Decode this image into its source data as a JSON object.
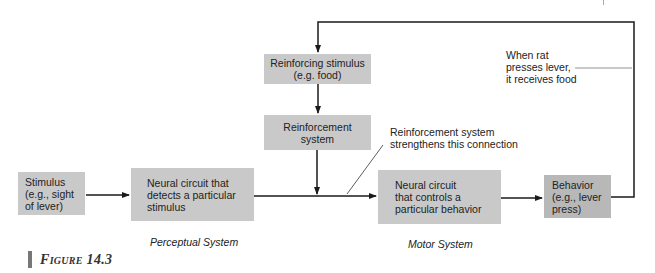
{
  "diagram": {
    "nodes": {
      "reinforcing_stimulus": {
        "lines": [
          "Reinforcing stimulus",
          "(e.g. food)"
        ]
      },
      "reinforcement_system": {
        "lines": [
          "Reinforcement",
          "system"
        ]
      },
      "stimulus": {
        "lines": [
          "Stimulus",
          "(e.g., sight",
          "of lever)"
        ]
      },
      "detect_circuit": {
        "lines": [
          "Neural circuit that",
          "detects a particular",
          "stimulus"
        ]
      },
      "control_circuit": {
        "lines": [
          "Neural circuit",
          "that controls a",
          "particular behavior"
        ]
      },
      "behavior": {
        "lines": [
          "Behavior",
          "(e.g., lever",
          "press)"
        ]
      }
    },
    "annotations": {
      "strengthens": [
        "Reinforcement system",
        "strengthens this connection"
      ],
      "feedback": [
        "When rat",
        "presses lever,",
        "it receives food"
      ]
    },
    "system_labels": {
      "perceptual": "Perceptual System",
      "motor": "Motor System"
    },
    "edges": [
      {
        "from": "stimulus",
        "to": "detect_circuit"
      },
      {
        "from": "detect_circuit",
        "to": "control_circuit"
      },
      {
        "from": "control_circuit",
        "to": "behavior"
      },
      {
        "from": "behavior",
        "to": "reinforcing_stimulus",
        "label": "feedback"
      },
      {
        "from": "reinforcing_stimulus",
        "to": "reinforcement_system"
      },
      {
        "from": "reinforcement_system",
        "to": "detect_circuit-control_circuit connection"
      }
    ]
  },
  "caption": {
    "figure_label": "Figure 14.3"
  },
  "colors": {
    "box_fill": "#c9c9c9",
    "behavior_fill": "#b8b8b8",
    "line": "#1a1a1a"
  }
}
